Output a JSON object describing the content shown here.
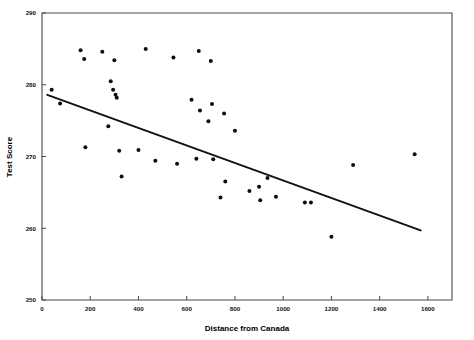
{
  "chart_data": {
    "type": "scatter",
    "title": "",
    "subtitle": "",
    "xlabel": "Distance from Canada",
    "ylabel": "Test Score",
    "xlim": [
      0,
      1700
    ],
    "ylim": [
      250,
      290
    ],
    "xticks": [
      0,
      200,
      400,
      600,
      800,
      1000,
      1200,
      1400,
      1600
    ],
    "xtick_labels": [
      "0",
      "200",
      "400",
      "600",
      "800",
      "1000",
      "1200",
      "1400",
      "1600"
    ],
    "yticks": [
      250,
      260,
      270,
      280,
      290
    ],
    "ytick_labels": [
      "250",
      "260",
      "270",
      "280",
      "290"
    ],
    "grid": false,
    "legend": null,
    "annotations": [],
    "marker_color": "#0d0d0d",
    "line_color": "#111111",
    "frame_color": "#4a4a4a",
    "background_color": "#ffffff",
    "points": [
      {
        "x": 40,
        "y": 279.3
      },
      {
        "x": 75,
        "y": 277.4
      },
      {
        "x": 160,
        "y": 284.8
      },
      {
        "x": 175,
        "y": 283.6
      },
      {
        "x": 180,
        "y": 271.3
      },
      {
        "x": 250,
        "y": 284.6
      },
      {
        "x": 275,
        "y": 274.2
      },
      {
        "x": 285,
        "y": 280.5
      },
      {
        "x": 295,
        "y": 279.3
      },
      {
        "x": 300,
        "y": 283.4
      },
      {
        "x": 305,
        "y": 278.6
      },
      {
        "x": 310,
        "y": 278.2
      },
      {
        "x": 320,
        "y": 270.8
      },
      {
        "x": 330,
        "y": 267.2
      },
      {
        "x": 400,
        "y": 270.9
      },
      {
        "x": 430,
        "y": 285.0
      },
      {
        "x": 470,
        "y": 269.4
      },
      {
        "x": 545,
        "y": 283.8
      },
      {
        "x": 560,
        "y": 269.0
      },
      {
        "x": 620,
        "y": 277.9
      },
      {
        "x": 640,
        "y": 269.7
      },
      {
        "x": 650,
        "y": 284.7
      },
      {
        "x": 655,
        "y": 276.4
      },
      {
        "x": 690,
        "y": 274.9
      },
      {
        "x": 700,
        "y": 283.3
      },
      {
        "x": 705,
        "y": 277.3
      },
      {
        "x": 710,
        "y": 269.6
      },
      {
        "x": 740,
        "y": 264.3
      },
      {
        "x": 755,
        "y": 276.0
      },
      {
        "x": 760,
        "y": 266.5
      },
      {
        "x": 800,
        "y": 273.6
      },
      {
        "x": 860,
        "y": 265.2
      },
      {
        "x": 900,
        "y": 265.8
      },
      {
        "x": 905,
        "y": 263.9
      },
      {
        "x": 935,
        "y": 267.0
      },
      {
        "x": 970,
        "y": 264.4
      },
      {
        "x": 1090,
        "y": 263.6
      },
      {
        "x": 1115,
        "y": 263.6
      },
      {
        "x": 1200,
        "y": 258.8
      },
      {
        "x": 1290,
        "y": 268.8
      },
      {
        "x": 1545,
        "y": 270.3
      }
    ],
    "fit_line": {
      "x_start": 22,
      "y_start": 278.6,
      "x_end": 1570,
      "y_end": 259.7
    }
  }
}
